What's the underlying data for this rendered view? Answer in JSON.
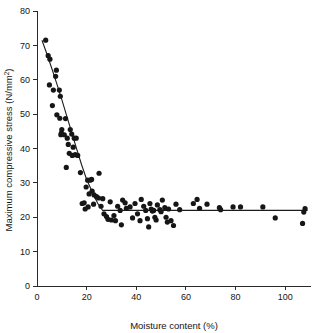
{
  "chart_data": {
    "type": "scatter",
    "title": "",
    "xlabel": "Moisture content (%)",
    "ylabel": "Maximum compressive stress (N/mm",
    "ylabel_superscript": "2",
    "ylabel_suffix": ")",
    "ylabel_full": "Maximum compressive stress (N/mm2)",
    "xlim": [
      0,
      110
    ],
    "ylim": [
      0,
      80
    ],
    "xticks": [
      0,
      20,
      40,
      60,
      80,
      100
    ],
    "xtick_labels": [
      "0",
      "20",
      "40",
      "60",
      "80",
      "100"
    ],
    "yticks": [
      0,
      10,
      20,
      30,
      40,
      50,
      60,
      70,
      80
    ],
    "ytick_labels": [
      "0",
      "10",
      "20",
      "30",
      "40",
      "50",
      "60",
      "70",
      "80"
    ],
    "grid": false,
    "legend": null,
    "marker": "filled-circle",
    "marker_color": "#161616",
    "marker_size": 2.6,
    "line_color": "#1c1c1c",
    "points": [
      [
        3.5,
        71.5
      ],
      [
        4.5,
        67.0
      ],
      [
        5.2,
        66.0
      ],
      [
        5.0,
        58.5
      ],
      [
        7.8,
        62.8
      ],
      [
        7.5,
        61.0
      ],
      [
        6.2,
        52.5
      ],
      [
        6.6,
        57.0
      ],
      [
        9.0,
        57.0
      ],
      [
        9.4,
        55.2
      ],
      [
        8.0,
        49.8
      ],
      [
        9.2,
        48.8
      ],
      [
        10.0,
        45.5
      ],
      [
        9.6,
        44.0
      ],
      [
        9.8,
        44.5
      ],
      [
        11.0,
        44.0
      ],
      [
        11.5,
        48.7
      ],
      [
        12.2,
        43.0
      ],
      [
        12.6,
        41.2
      ],
      [
        13.4,
        45.5
      ],
      [
        14.0,
        44.2
      ],
      [
        15.0,
        43.0
      ],
      [
        15.8,
        43.0
      ],
      [
        13.0,
        38.6
      ],
      [
        14.2,
        38.0
      ],
      [
        14.6,
        40.4
      ],
      [
        15.4,
        38.2
      ],
      [
        16.4,
        38.0
      ],
      [
        11.8,
        34.5
      ],
      [
        17.5,
        33.0
      ],
      [
        20.4,
        30.8
      ],
      [
        21.4,
        30.8
      ],
      [
        22.0,
        31.0
      ],
      [
        25.0,
        32.8
      ],
      [
        19.8,
        28.8
      ],
      [
        21.0,
        26.8
      ],
      [
        22.2,
        27.6
      ],
      [
        23.0,
        26.5
      ],
      [
        24.0,
        26.0
      ],
      [
        24.8,
        25.6
      ],
      [
        26.5,
        25.4
      ],
      [
        18.2,
        24.0
      ],
      [
        19.0,
        24.2
      ],
      [
        20.6,
        23.0
      ],
      [
        19.4,
        22.4
      ],
      [
        22.8,
        23.8
      ],
      [
        25.8,
        23.2
      ],
      [
        27.0,
        21.0
      ],
      [
        28.0,
        20.2
      ],
      [
        28.6,
        19.4
      ],
      [
        30.0,
        19.2
      ],
      [
        31.0,
        20.5
      ],
      [
        31.6,
        19.0
      ],
      [
        29.5,
        24.5
      ],
      [
        32.5,
        23.2
      ],
      [
        33.5,
        22.0
      ],
      [
        34.5,
        25.0
      ],
      [
        35.5,
        24.2
      ],
      [
        34.0,
        17.8
      ],
      [
        36.0,
        22.6
      ],
      [
        37.5,
        23.0
      ],
      [
        38.5,
        19.8
      ],
      [
        39.5,
        24.0
      ],
      [
        40.5,
        21.0
      ],
      [
        41.5,
        19.0
      ],
      [
        42.0,
        25.2
      ],
      [
        43.0,
        23.2
      ],
      [
        43.8,
        22.0
      ],
      [
        44.5,
        19.6
      ],
      [
        45.0,
        17.2
      ],
      [
        45.5,
        24.0
      ],
      [
        46.0,
        22.4
      ],
      [
        46.5,
        21.8
      ],
      [
        47.0,
        22.0
      ],
      [
        47.5,
        20.0
      ],
      [
        48.0,
        19.2
      ],
      [
        48.5,
        23.6
      ],
      [
        49.5,
        22.2
      ],
      [
        50.0,
        21.6
      ],
      [
        50.5,
        25.0
      ],
      [
        51.5,
        22.8
      ],
      [
        52.0,
        20.0
      ],
      [
        52.5,
        18.6
      ],
      [
        53.0,
        22.4
      ],
      [
        54.0,
        19.0
      ],
      [
        55.0,
        17.6
      ],
      [
        56.0,
        23.8
      ],
      [
        57.5,
        22.2
      ],
      [
        63.0,
        24.0
      ],
      [
        64.5,
        25.2
      ],
      [
        65.5,
        22.6
      ],
      [
        68.5,
        23.8
      ],
      [
        73.5,
        22.8
      ],
      [
        74.0,
        22.2
      ],
      [
        79.0,
        23.0
      ],
      [
        82.0,
        23.0
      ],
      [
        91.0,
        23.0
      ],
      [
        96.0,
        19.8
      ],
      [
        107.5,
        21.5
      ],
      [
        108.0,
        22.5
      ],
      [
        107.0,
        18.2
      ]
    ],
    "fit_curve": {
      "description": "Exponential decay to plateau",
      "breakpoint_x": 26.5,
      "plateau_y": 22.0,
      "start": [
        2.0,
        71.5
      ],
      "points": [
        [
          2.0,
          71.5
        ],
        [
          4.0,
          67.5
        ],
        [
          6.0,
          63.2
        ],
        [
          8.0,
          58.8
        ],
        [
          10.0,
          54.2
        ],
        [
          12.0,
          49.4
        ],
        [
          14.0,
          44.6
        ],
        [
          16.0,
          39.8
        ],
        [
          18.0,
          35.2
        ],
        [
          20.0,
          31.0
        ],
        [
          21.5,
          28.6
        ],
        [
          23.0,
          26.2
        ],
        [
          24.5,
          24.0
        ],
        [
          26.0,
          22.4
        ],
        [
          26.5,
          22.0
        ],
        [
          40.0,
          22.0
        ],
        [
          60.0,
          22.0
        ],
        [
          80.0,
          22.0
        ],
        [
          100.0,
          22.0
        ],
        [
          109.0,
          22.0
        ]
      ]
    }
  },
  "geometry": {
    "plot_left": 37,
    "plot_right": 310,
    "plot_top": 11,
    "plot_bottom": 286
  }
}
